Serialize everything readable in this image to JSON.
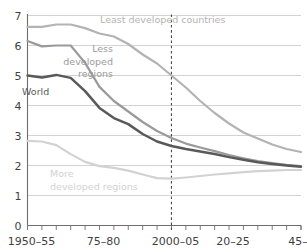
{
  "chart_data": {
    "type": "line",
    "title": "",
    "xlabel": "",
    "ylabel": "",
    "ylim": [
      0,
      7
    ],
    "yticks": [
      "0",
      "1",
      "2",
      "3",
      "4",
      "5",
      "6",
      "7"
    ],
    "grid": true,
    "grid_axis": "y",
    "legend": "inline-labels",
    "x": [
      "1950-55",
      "1955-60",
      "1960-65",
      "1965-70",
      "1970-75",
      "1975-80",
      "1980-85",
      "1985-90",
      "1990-95",
      "1995-2000",
      "2000-05",
      "2005-10",
      "2010-15",
      "2015-20",
      "2020-25",
      "2025-30",
      "2030-35",
      "2035-40",
      "2040-45",
      "2045-50"
    ],
    "xtick_labels": [
      "1950–55",
      "75–80",
      "2000–05",
      "20–25",
      "45–50"
    ],
    "xtick_label_indices": [
      0,
      5,
      10,
      14,
      19
    ],
    "annotations": [
      {
        "text": "2000–05 reference",
        "type": "vertical-dashed-line",
        "x_index": 10
      }
    ],
    "series": [
      {
        "name": "Least developed countries",
        "color": "#b3b3b3",
        "label_lines": [
          "Least developed countries"
        ],
        "values": [
          6.62,
          6.62,
          6.7,
          6.7,
          6.58,
          6.4,
          6.3,
          6.05,
          5.7,
          5.4,
          5.0,
          4.6,
          4.15,
          3.75,
          3.4,
          3.1,
          2.9,
          2.7,
          2.55,
          2.45
        ]
      },
      {
        "name": "Less developed regions",
        "color": "#9a9a9a",
        "label_lines": [
          "Less",
          "developed",
          "regions"
        ],
        "values": [
          6.15,
          5.97,
          6.0,
          6.0,
          5.42,
          4.62,
          4.15,
          3.8,
          3.45,
          3.15,
          2.92,
          2.73,
          2.6,
          2.48,
          2.35,
          2.24,
          2.15,
          2.08,
          2.02,
          1.98
        ]
      },
      {
        "name": "World",
        "color": "#595959",
        "label_lines": [
          "World"
        ],
        "values": [
          5.0,
          4.93,
          5.02,
          4.92,
          4.48,
          3.92,
          3.58,
          3.38,
          3.05,
          2.8,
          2.65,
          2.55,
          2.47,
          2.38,
          2.28,
          2.19,
          2.11,
          2.05,
          2.0,
          1.96
        ]
      },
      {
        "name": "More developed regions",
        "color": "#d2d2d2",
        "label_lines": [
          "More",
          "developed regions"
        ],
        "values": [
          2.82,
          2.8,
          2.68,
          2.38,
          2.12,
          1.98,
          1.92,
          1.83,
          1.7,
          1.58,
          1.56,
          1.6,
          1.65,
          1.7,
          1.74,
          1.78,
          1.81,
          1.83,
          1.85,
          1.85
        ]
      }
    ]
  },
  "axis": {
    "y_ticks": [
      "0",
      "1",
      "2",
      "3",
      "4",
      "5",
      "6",
      "7"
    ],
    "x_ticks": [
      "1950–55",
      "75–80",
      "2000–05",
      "20–25",
      "45–50"
    ]
  },
  "labels": {
    "least_developed": "Least developed countries",
    "less_developed_1": "Less",
    "less_developed_2": "developed",
    "less_developed_3": "regions",
    "world": "World",
    "more_developed_1": "More",
    "more_developed_2": "developed regions"
  },
  "colors": {
    "least_developed": "#b3b3b3",
    "less_developed": "#9a9a9a",
    "world": "#595959",
    "more_developed": "#d2d2d2",
    "grid": "#c8c8c8",
    "axis": "#6d6d6d",
    "tick_text": "#3f3f3f",
    "dash": "#4a4a4a"
  }
}
